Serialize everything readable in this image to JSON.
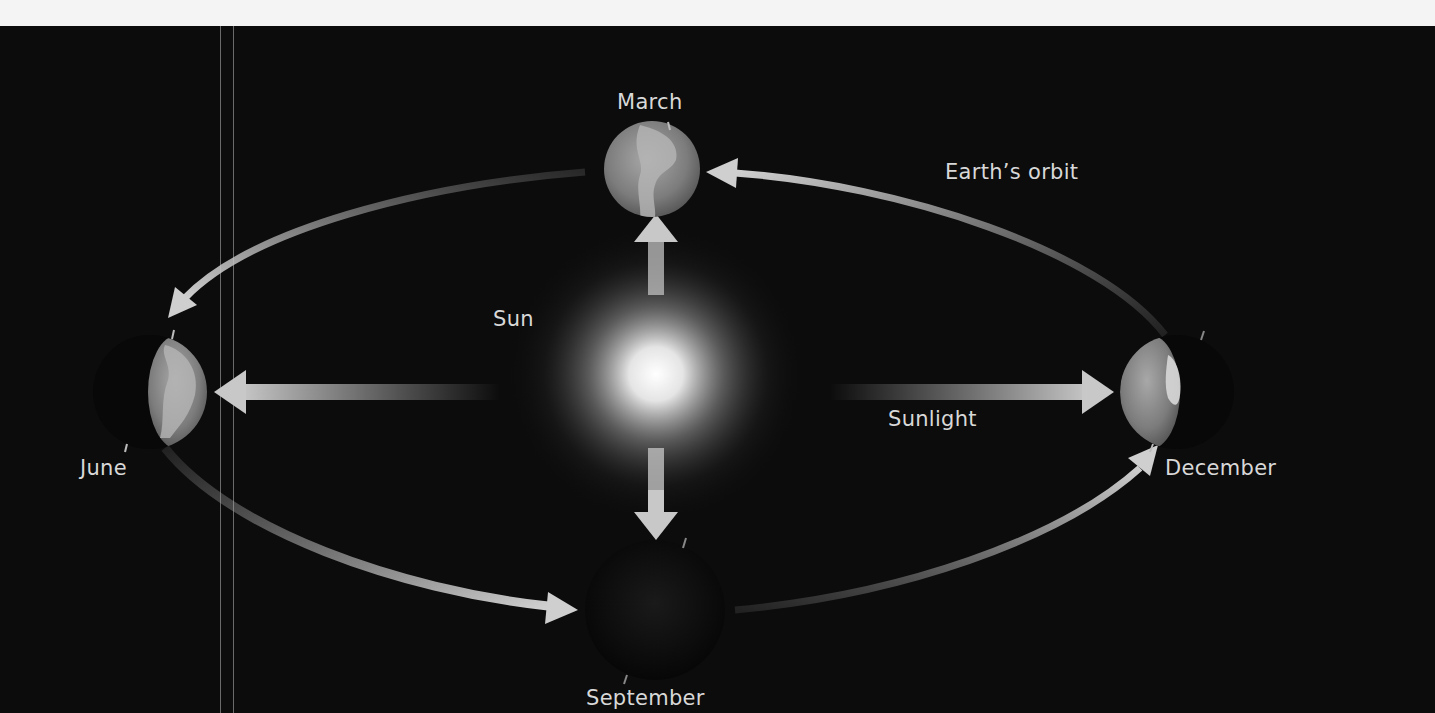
{
  "diagram": {
    "type": "earth-orbit-seasons",
    "background_color": "#0c0c0c",
    "text_color": "#d8d8d8",
    "arrow_color": "#bdbdbd",
    "labels": {
      "sun": "Sun",
      "sunlight": "Sunlight",
      "orbit": "Earth’s orbit"
    },
    "earth_positions": [
      {
        "month": "March",
        "illumination": "full"
      },
      {
        "month": "June",
        "illumination": "right-half"
      },
      {
        "month": "September",
        "illumination": "dark"
      },
      {
        "month": "December",
        "illumination": "left-half"
      }
    ]
  }
}
